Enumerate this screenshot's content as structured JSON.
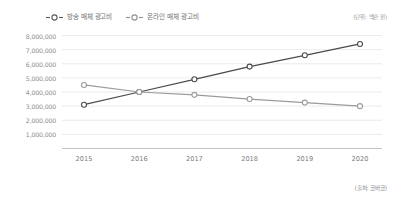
{
  "legend": {
    "position": "top-left",
    "items": [
      {
        "label": "방송 매체 광고비",
        "color": "#4a4a4a",
        "marker": "circle-dash-marker"
      },
      {
        "label": "온라인 매체 광고비",
        "color": "#9b9b9b",
        "marker": "circle-dash-marker"
      }
    ]
  },
  "notes": {
    "unit": "(단위: 백만 원)",
    "source": "(출처: 코바코)"
  },
  "chart_data": {
    "type": "line",
    "title": "",
    "subtitle": "",
    "xlabel": "",
    "ylabel": "",
    "categories": [
      "2015",
      "2016",
      "2017",
      "2018",
      "2019",
      "2020"
    ],
    "x": [
      2015,
      2016,
      2017,
      2018,
      2019,
      2020
    ],
    "series": [
      {
        "name": "방송 매체 광고비",
        "color": "#4a4a4a",
        "values": [
          3100000,
          4000000,
          4900000,
          5800000,
          6600000,
          7400000
        ]
      },
      {
        "name": "온라인 매체 광고비",
        "color": "#9b9b9b",
        "values": [
          4500000,
          4000000,
          3800000,
          3500000,
          3250000,
          3000000
        ]
      }
    ],
    "ylim": [
      0,
      8000000
    ],
    "yticks": [
      1000000,
      2000000,
      3000000,
      4000000,
      5000000,
      6000000,
      7000000,
      8000000
    ],
    "ytick_labels": [
      "1,000,000",
      "2,000,000",
      "3,000,000",
      "4,000,000",
      "5,000,000",
      "6,000,000",
      "7,000,000",
      "8,000,000"
    ],
    "grid": true,
    "grid_axis": "y",
    "legend_position": "top-left",
    "marker": "open-circle"
  }
}
